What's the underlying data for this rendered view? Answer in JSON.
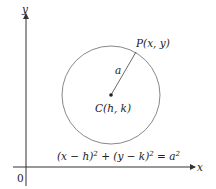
{
  "diagram": {
    "axes": {
      "x_label": "x",
      "y_label": "y",
      "origin_label": "0"
    },
    "circle": {
      "stroke": "#888888",
      "center_label": "C(h, k)",
      "point_label": "P(x, y)",
      "radius_label": "a"
    },
    "equation": {
      "part1": "(x − h)",
      "sup1": "2",
      "part2": " + (y − k)",
      "sup2": "2",
      "part3": " = a",
      "sup3": "2"
    }
  }
}
